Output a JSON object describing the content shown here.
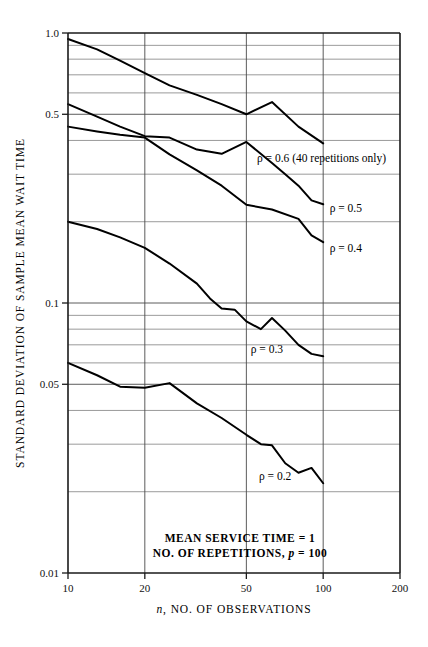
{
  "chart_data": {
    "type": "line",
    "title": "",
    "xlabel": "n, NO. OF OBSERVATIONS",
    "ylabel": "STANDARD DEVIATION OF SAMPLE MEAN WAIT TIME",
    "xscale": "log",
    "yscale": "log",
    "xlim": [
      10,
      200
    ],
    "ylim": [
      0.01,
      1.0
    ],
    "grid": true,
    "legend_position": "inline-right-of-curve",
    "xticks": [
      10,
      20,
      50,
      100,
      200
    ],
    "xtick_labels": [
      "10",
      "20",
      "50",
      "100",
      "200"
    ],
    "yticks": [
      0.01,
      0.05,
      0.1,
      0.5,
      1.0
    ],
    "ytick_labels": [
      "0.01",
      "0.05",
      "0.1",
      "0.5",
      "1.0"
    ],
    "y_gridlines": [
      0.01,
      0.02,
      0.03,
      0.04,
      0.05,
      0.06,
      0.07,
      0.08,
      0.09,
      0.1,
      0.2,
      0.3,
      0.4,
      0.5,
      0.6,
      0.7,
      0.8,
      0.9,
      1.0
    ],
    "series": [
      {
        "name": "rho-0.6",
        "label": "ρ = 0.6 (40 repetitions only)",
        "label_x": 55,
        "label_y": 0.345,
        "x": [
          10,
          13,
          16,
          20,
          25,
          32,
          40,
          50,
          63,
          80,
          100
        ],
        "y": [
          0.95,
          0.87,
          0.79,
          0.71,
          0.64,
          0.59,
          0.545,
          0.5,
          0.555,
          0.45,
          0.39
        ]
      },
      {
        "name": "rho-0.5",
        "label": "ρ = 0.5",
        "label_x": 106,
        "label_y": 0.224,
        "x": [
          10,
          13,
          16,
          20,
          25,
          32,
          40,
          50,
          63,
          71,
          80,
          90,
          100
        ],
        "y": [
          0.545,
          0.49,
          0.45,
          0.415,
          0.41,
          0.37,
          0.357,
          0.395,
          0.33,
          0.3,
          0.272,
          0.24,
          0.232
        ]
      },
      {
        "name": "rho-0.4",
        "label": "ρ = 0.4",
        "label_x": 106,
        "label_y": 0.16,
        "x": [
          10,
          13,
          16,
          20,
          25,
          32,
          40,
          50,
          63,
          80,
          90,
          100
        ],
        "y": [
          0.45,
          0.432,
          0.42,
          0.41,
          0.355,
          0.31,
          0.272,
          0.231,
          0.222,
          0.205,
          0.178,
          0.168
        ]
      },
      {
        "name": "rho-0.3",
        "label": "ρ = 0.3",
        "label_x": 52,
        "label_y": 0.0675,
        "x": [
          10,
          13,
          16,
          20,
          25,
          32,
          36,
          40,
          45,
          50,
          57,
          63,
          71,
          80,
          90,
          100
        ],
        "y": [
          0.2,
          0.188,
          0.175,
          0.16,
          0.14,
          0.118,
          0.104,
          0.0955,
          0.0945,
          0.0855,
          0.08,
          0.088,
          0.079,
          0.07,
          0.0648,
          0.0635
        ]
      },
      {
        "name": "rho-0.2",
        "label": "ρ = 0.2",
        "label_x": 56,
        "label_y": 0.0228,
        "x": [
          10,
          13,
          16,
          20,
          25,
          32,
          40,
          50,
          57,
          63,
          71,
          80,
          90,
          100
        ],
        "y": [
          0.06,
          0.054,
          0.049,
          0.0485,
          0.0505,
          0.0425,
          0.0375,
          0.0325,
          0.03,
          0.0297,
          0.0255,
          0.0235,
          0.0245,
          0.0215
        ]
      }
    ],
    "annotations": [
      {
        "text": "MEAN SERVICE TIME = 1",
        "x": 240,
        "y": 543
      },
      {
        "text": "NO. OF REPETITIONS, p = 100",
        "x": 240,
        "y": 557
      }
    ]
  },
  "notes": {
    "line1_pre": "MEAN SERVICE TIME = 1",
    "line2_pre": "NO. OF REPETITIONS, ",
    "line2_ital": "p",
    "line2_post": " = 100"
  }
}
